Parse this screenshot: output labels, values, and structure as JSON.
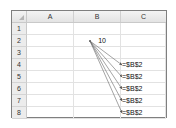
{
  "sheet": {
    "columns": [
      "A",
      "B",
      "C"
    ],
    "rows": [
      "1",
      "2",
      "3",
      "4",
      "5",
      "6",
      "7",
      "8"
    ],
    "cells": {
      "B2": "10",
      "C4": "=$B$2",
      "C5": "=$B$2",
      "C6": "=$B$2",
      "C7": "=$B$2",
      "C8": "=$B$2"
    }
  },
  "trace_arrows": {
    "source": "B2",
    "targets": [
      "C4",
      "C5",
      "C6",
      "C7",
      "C8"
    ],
    "color": "#555555"
  }
}
